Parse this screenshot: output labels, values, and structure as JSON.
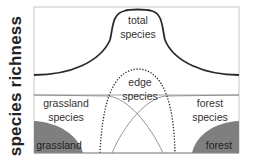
{
  "axis": {
    "ylabel": "species richness"
  },
  "labels": {
    "total_species": {
      "line1": "total",
      "line2": "species"
    },
    "edge_species": {
      "line1": "edge",
      "line2": "species"
    },
    "grassland_species": {
      "line1": "grassland",
      "line2": "species"
    },
    "forest_species": {
      "line1": "forest",
      "line2": "species"
    },
    "grassland_habitat": "grassland",
    "forest_habitat": "forest"
  },
  "colors": {
    "frame": "#c8c8c8",
    "total_curve": "#2a2a2a",
    "edge_curve": "#2a2a2a",
    "species_curves": "#8a8a8a",
    "habitat_fill": "#7f7f7f",
    "text": "#333333"
  },
  "curves": [
    {
      "name": "total species",
      "style": "solid-thick"
    },
    {
      "name": "edge species",
      "style": "dotted"
    },
    {
      "name": "grassland species",
      "style": "thin"
    },
    {
      "name": "forest species",
      "style": "thin"
    }
  ]
}
